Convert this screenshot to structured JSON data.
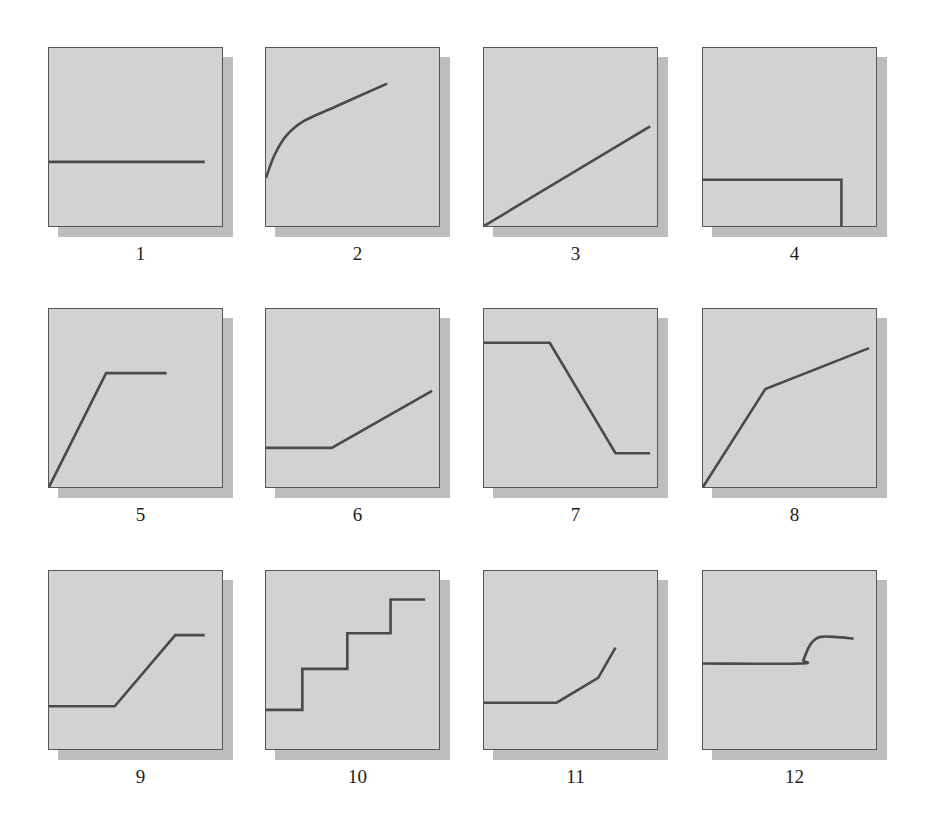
{
  "figure": {
    "colors": {
      "panel_fill": "#d2d2d2",
      "shadow": "#bdbdbd",
      "border": "#555555",
      "curve": "#4a4a4a"
    },
    "panels": [
      {
        "label": "1",
        "shape": "flat horizontal line",
        "points": [
          [
            0,
            36
          ],
          [
            90,
            36
          ]
        ]
      },
      {
        "label": "2",
        "shape": "concave increasing curve",
        "points": [
          [
            0,
            27
          ],
          [
            5,
            40
          ],
          [
            12,
            51
          ],
          [
            22,
            59
          ],
          [
            40,
            67
          ],
          [
            70,
            80
          ]
        ],
        "smooth": true
      },
      {
        "label": "3",
        "shape": "straight increasing line",
        "points": [
          [
            0,
            0
          ],
          [
            96,
            56
          ]
        ]
      },
      {
        "label": "4",
        "shape": "flat then drops to zero",
        "points": [
          [
            0,
            26
          ],
          [
            80,
            26
          ],
          [
            80,
            0
          ]
        ]
      },
      {
        "label": "5",
        "shape": "rising then plateau",
        "points": [
          [
            0,
            0
          ],
          [
            33,
            64
          ],
          [
            68,
            64
          ]
        ]
      },
      {
        "label": "6",
        "shape": "plateau then rising",
        "points": [
          [
            0,
            22
          ],
          [
            38,
            22
          ],
          [
            96,
            54
          ]
        ]
      },
      {
        "label": "7",
        "shape": "plateau, decreasing, low plateau",
        "points": [
          [
            0,
            81
          ],
          [
            38,
            81
          ],
          [
            76,
            19
          ],
          [
            96,
            19
          ]
        ]
      },
      {
        "label": "8",
        "shape": "steep rise then gentler rise",
        "points": [
          [
            0,
            0
          ],
          [
            36,
            55
          ],
          [
            96,
            78
          ]
        ]
      },
      {
        "label": "9",
        "shape": "low plateau, rising, high plateau",
        "points": [
          [
            0,
            24
          ],
          [
            38,
            24
          ],
          [
            73,
            64
          ],
          [
            90,
            64
          ]
        ]
      },
      {
        "label": "10",
        "shape": "staircase",
        "points": [
          [
            0,
            22
          ],
          [
            21,
            22
          ],
          [
            21,
            45
          ],
          [
            47,
            45
          ],
          [
            47,
            65
          ],
          [
            72,
            65
          ],
          [
            72,
            84
          ],
          [
            92,
            84
          ]
        ]
      },
      {
        "label": "11",
        "shape": "flat then increasing at increasing rate",
        "points": [
          [
            0,
            26
          ],
          [
            42,
            26
          ],
          [
            66,
            40
          ],
          [
            76,
            57
          ]
        ]
      },
      {
        "label": "12",
        "shape": "flat then sigmoid step up",
        "points": [
          [
            0,
            48
          ],
          [
            56,
            48
          ],
          [
            58,
            50
          ],
          [
            61,
            57
          ],
          [
            64,
            61
          ],
          [
            68,
            63
          ],
          [
            76,
            63
          ],
          [
            87,
            62
          ]
        ],
        "smooth": true
      }
    ]
  }
}
